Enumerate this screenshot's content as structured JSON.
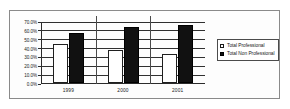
{
  "chart_data": {
    "type": "bar",
    "title": "",
    "subtitle": "",
    "xlabel": "",
    "ylabel": "",
    "categories": [
      "1999",
      "2000",
      "2001"
    ],
    "series": [
      {
        "name": "Total Professional",
        "swatch": "white-square",
        "color": "#ffffff",
        "values": [
          43.5,
          37.5,
          33.0
        ]
      },
      {
        "name": "Total Non Professional",
        "swatch": "black-square",
        "color": "#111111",
        "values": [
          56.5,
          63.5,
          66.0
        ]
      }
    ],
    "ylim": [
      0,
      70
    ],
    "ytick_step": 10,
    "ytick_labels": [
      "0.0%",
      "10.0%",
      "20.0%",
      "30.0%",
      "40.0%",
      "50.0%",
      "60.0%",
      "70.0%"
    ],
    "ytick_values": [
      0,
      10,
      20,
      30,
      40,
      50,
      60,
      70
    ],
    "grid": "horizontal",
    "legend_position": "right",
    "legend": [
      {
        "label": "Total Professional",
        "swatch": "white-square"
      },
      {
        "label": "Total Non Professional",
        "swatch": "black-square"
      }
    ]
  }
}
